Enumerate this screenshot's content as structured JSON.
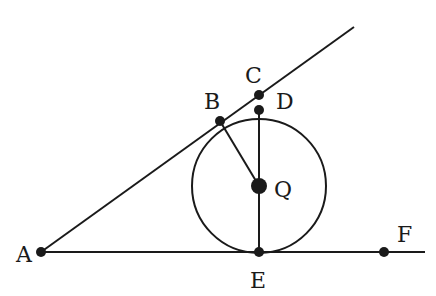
{
  "diagram": {
    "type": "geometry",
    "colors": {
      "stroke": "#1a1a1a",
      "background": "#ffffff"
    },
    "points": {
      "A": {
        "label": "A",
        "x": 41,
        "y": 252
      },
      "B": {
        "label": "B",
        "x": 220,
        "y": 121
      },
      "C": {
        "label": "C",
        "x": 259,
        "y": 95
      },
      "D": {
        "label": "D",
        "x": 259,
        "y": 110
      },
      "Q": {
        "label": "Q",
        "x": 259,
        "y": 186
      },
      "E": {
        "label": "E",
        "x": 259,
        "y": 252
      },
      "F": {
        "label": "F",
        "x": 384,
        "y": 252
      }
    },
    "circle": {
      "center": "Q",
      "radius": 67
    },
    "segments": [
      {
        "from": "A",
        "to": "ray-end-upper"
      },
      {
        "from": "A",
        "to": "ray-end-lower"
      },
      {
        "from": "B",
        "to": "Q"
      },
      {
        "from": "D",
        "to": "E"
      }
    ]
  }
}
